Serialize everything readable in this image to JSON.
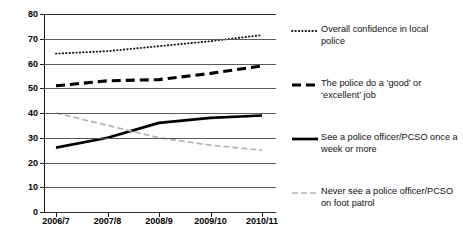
{
  "chart_data": {
    "type": "line",
    "title": "",
    "xlabel": "",
    "ylabel": "",
    "ylim": [
      0,
      80
    ],
    "ytick_step": 10,
    "yticks": [
      0,
      10,
      20,
      30,
      40,
      50,
      60,
      70,
      80
    ],
    "grid": true,
    "legend_position": "right",
    "categories": [
      "2006/7",
      "2007/8",
      "2008/9",
      "2009/10",
      "2010/11"
    ],
    "series": [
      {
        "name": "Overall confidence in local police",
        "legend_label": "Overall confidence in local\npolice",
        "style": "dotted",
        "color": "#1a1a1a",
        "values": [
          64,
          65,
          67,
          69,
          71.5
        ]
      },
      {
        "name": "The police do a 'good' or 'excellent' job",
        "legend_label": "The police do a ‘good’ or\n‘excellent’ job",
        "style": "dashed",
        "color": "#000000",
        "values": [
          51,
          53,
          53.5,
          56,
          59
        ]
      },
      {
        "name": "See a police officer/PCSO once a week or more",
        "legend_label": "See a police officer/PCSO once a\nweek  or more",
        "style": "solid",
        "color": "#000000",
        "values": [
          26,
          30,
          36,
          38,
          39
        ]
      },
      {
        "name": "Never see a police officer/PCSO on foot patrol",
        "legend_label": "Never see a police officer/PCSO\non foot patrol",
        "style": "dash-dot-grey",
        "color": "#b3b3b3",
        "values": [
          40,
          35,
          30,
          27,
          25
        ]
      }
    ]
  },
  "colors": {
    "gridline": "#5a5a5a",
    "axis": "#1a1a1a",
    "grey_series": "#b3b3b3",
    "background": "#ffffff"
  }
}
